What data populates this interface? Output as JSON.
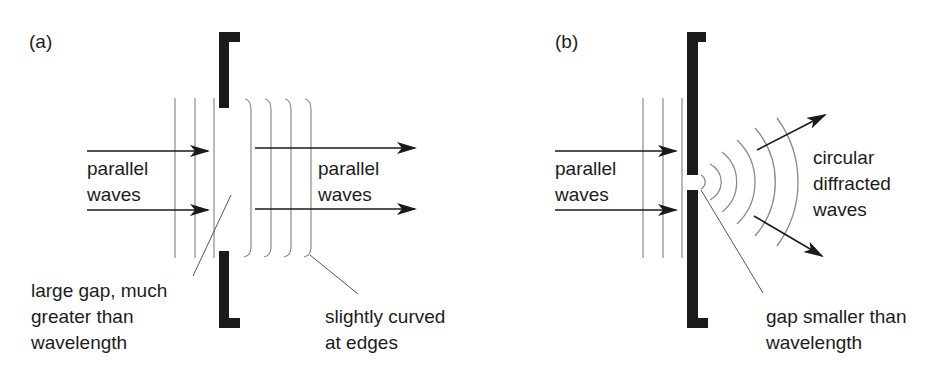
{
  "figure": {
    "panels": [
      {
        "id": "a",
        "tag": "(a)",
        "incoming_label": [
          "parallel",
          "waves"
        ],
        "outgoing_label": [
          "parallel",
          "waves"
        ],
        "gap_label": [
          "large gap, much",
          "greater than",
          "wavelength"
        ],
        "edge_label": [
          "slightly curved",
          "at edges"
        ]
      },
      {
        "id": "b",
        "tag": "(b)",
        "incoming_label": [
          "parallel",
          "waves"
        ],
        "outgoing_label": [
          "circular",
          "diffracted",
          "waves"
        ],
        "gap_label": [
          "gap smaller than",
          "wavelength"
        ]
      }
    ],
    "colors": {
      "barrier": "#1a1a1a",
      "wavefront": "#8a8a8a",
      "arrow": "#1a1a1a",
      "text": "#1c1c1c"
    }
  }
}
